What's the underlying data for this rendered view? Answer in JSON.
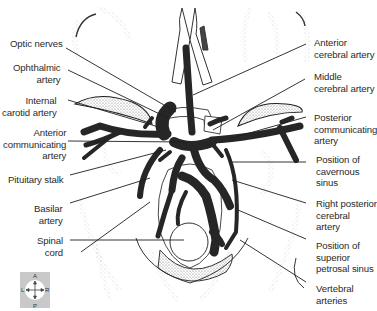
{
  "figure": {
    "labels_left": [
      {
        "id": "optic-nerves",
        "lines": [
          "Optic nerves"
        ]
      },
      {
        "id": "ophthalmic-artery",
        "lines": [
          "Ophthalmic",
          "artery"
        ]
      },
      {
        "id": "internal-carotid-artery",
        "lines": [
          "Internal",
          "carotid artery"
        ]
      },
      {
        "id": "anterior-communicating-artery",
        "lines": [
          "Anterior",
          "communicating",
          "artery"
        ]
      },
      {
        "id": "pituitary-stalk",
        "lines": [
          "Pituitary stalk"
        ]
      },
      {
        "id": "basilar-artery",
        "lines": [
          "Basilar",
          "artery"
        ]
      },
      {
        "id": "spinal-cord",
        "lines": [
          "Spinal",
          "cord"
        ]
      }
    ],
    "labels_right": [
      {
        "id": "anterior-cerebral-artery",
        "lines": [
          "Anterior",
          "cerebral artery"
        ]
      },
      {
        "id": "middle-cerebral-artery",
        "lines": [
          "Middle",
          "cerebral artery"
        ]
      },
      {
        "id": "posterior-communicating-artery",
        "lines": [
          "Posterior",
          "communicating",
          "artery"
        ]
      },
      {
        "id": "position-of-cavernous-sinus",
        "lines": [
          "Position of",
          "cavernous",
          "sinus"
        ]
      },
      {
        "id": "right-posterior-cerebral-artery",
        "lines": [
          "Right  posterior",
          "cerebral",
          "artery"
        ]
      },
      {
        "id": "position-of-superior-petrosal-sinus",
        "lines": [
          "Position of",
          "superior",
          "petrosal sinus"
        ]
      },
      {
        "id": "vertebral-arteries",
        "lines": [
          "Vertebral",
          "arteries"
        ]
      }
    ],
    "orientation": {
      "top": "A",
      "bottom": "P",
      "left": "L",
      "right": "R"
    },
    "colors": {
      "vessel": "#262626",
      "line": "#1e1e1e",
      "stipple": "#9a9a9a",
      "compass_bg": "#c9c9c9",
      "medulla_fill": "#8c8c8c"
    }
  }
}
